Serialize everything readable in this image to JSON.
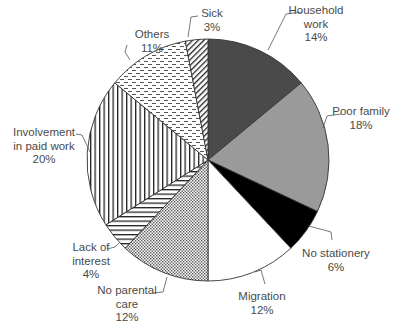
{
  "chart_data": {
    "type": "pie",
    "title": "",
    "start_angle_deg": 0,
    "direction": "clockwise",
    "legend": "none (direct labels)",
    "slices": [
      {
        "label": "Household work",
        "lines": [
          "Household",
          "work"
        ],
        "value": 14,
        "pct_text": "14%",
        "fill": "#4a4a4a",
        "pattern": "solid"
      },
      {
        "label": "Poor family",
        "lines": [
          "Poor family"
        ],
        "value": 18,
        "pct_text": "18%",
        "fill": "#9a9a9a",
        "pattern": "solid"
      },
      {
        "label": "No stationery",
        "lines": [
          "No stationery"
        ],
        "value": 6,
        "pct_text": "6%",
        "fill": "#000000",
        "pattern": "solid"
      },
      {
        "label": "Migration",
        "lines": [
          "Migration"
        ],
        "value": 12,
        "pct_text": "12%",
        "fill": "#ffffff",
        "pattern": "solid"
      },
      {
        "label": "No parental care",
        "lines": [
          "No parental",
          "care"
        ],
        "value": 12,
        "pct_text": "12%",
        "fill": "#ffffff",
        "pattern": "dots"
      },
      {
        "label": "Lack of interest",
        "lines": [
          "Lack of",
          "interest"
        ],
        "value": 4,
        "pct_text": "4%",
        "fill": "#ffffff",
        "pattern": "horizontal"
      },
      {
        "label": "Involvement in paid work",
        "lines": [
          "Involvement",
          "in paid work"
        ],
        "value": 20,
        "pct_text": "20%",
        "fill": "#ffffff",
        "pattern": "vertical"
      },
      {
        "label": "Others",
        "lines": [
          "Others"
        ],
        "value": 11,
        "pct_text": "11%",
        "fill": "#ffffff",
        "pattern": "dashes"
      },
      {
        "label": "Sick",
        "lines": [
          "Sick"
        ],
        "value": 3,
        "pct_text": "3%",
        "fill": "#ffffff",
        "pattern": "diagonal"
      }
    ]
  },
  "labels": [
    {
      "slice": 0,
      "x": 316,
      "y": 14,
      "anchor": "middle",
      "lines": [
        "Household",
        "work",
        "14%"
      ],
      "leader": "M302,12 L286,14 L268,50"
    },
    {
      "slice": 1,
      "x": 361,
      "y": 115,
      "anchor": "middle",
      "lines": [
        "Poor family",
        "18%"
      ],
      "leader": "M341,114 L327,116 L323,128"
    },
    {
      "slice": 2,
      "x": 336,
      "y": 257,
      "anchor": "middle",
      "lines": [
        "No stationery",
        "6%"
      ],
      "leader": "M332,240 L331,232 L309,226"
    },
    {
      "slice": 3,
      "x": 262,
      "y": 300,
      "anchor": "middle",
      "lines": [
        "Migration",
        "12%"
      ],
      "leader": "M265,284 L261,270 L255,272"
    },
    {
      "slice": 4,
      "x": 127,
      "y": 294,
      "anchor": "middle",
      "lines": [
        "No parental",
        "care",
        "12%"
      ],
      "leader": "M153,293 L163,292 L167,277"
    },
    {
      "slice": 5,
      "x": 91,
      "y": 251,
      "anchor": "middle",
      "lines": [
        "Lack of",
        "interest",
        "4%"
      ],
      "leader": "M107,249 L115,247 L120,242"
    },
    {
      "slice": 6,
      "x": 44,
      "y": 136,
      "anchor": "middle",
      "lines": [
        "Involvement",
        "in paid work",
        "20%"
      ],
      "leader": "M76,134 L82,135 L90,152"
    },
    {
      "slice": 7,
      "x": 152,
      "y": 38,
      "anchor": "middle",
      "lines": [
        "Others",
        "11%"
      ],
      "leader": "M127,45 L125,52 L130,60"
    },
    {
      "slice": 8,
      "x": 212,
      "y": 17,
      "anchor": "middle",
      "lines": [
        "Sick",
        "3%"
      ],
      "leader": "M198,16 L191,17 L188,37"
    }
  ],
  "geometry": {
    "cx": 208,
    "cy": 160,
    "r": 121
  }
}
